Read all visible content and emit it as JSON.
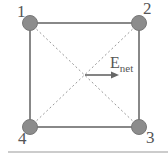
{
  "diagram": {
    "type": "square-charge-arrangement",
    "particles": [
      {
        "id": 1,
        "label": "1",
        "position": "top-left"
      },
      {
        "id": 2,
        "label": "2",
        "position": "top-right"
      },
      {
        "id": 3,
        "label": "3",
        "position": "bottom-right"
      },
      {
        "id": 4,
        "label": "4",
        "position": "bottom-left"
      }
    ],
    "arrow": {
      "label_main": "E",
      "label_sub": "net",
      "direction": "right",
      "origin": "center"
    },
    "colors": {
      "square_edge": "#888888",
      "diagonal": "#999999",
      "particle_fill": "#8c8c8c",
      "particle_stroke": "#777777",
      "arrow": "#666666",
      "text": "#555555",
      "baseline_rule": "#999999"
    }
  }
}
